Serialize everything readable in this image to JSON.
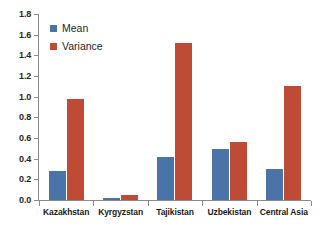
{
  "chart_data": {
    "type": "bar",
    "title": "",
    "xlabel": "",
    "ylabel": "",
    "ylim": [
      0,
      1.8
    ],
    "ytick_step": 0.2,
    "grid": false,
    "legend_position": "top-left",
    "categories": [
      "Kazakhstan",
      "Kyrgyzstan",
      "Tajikistan",
      "Uzbekistan",
      "Central Asia"
    ],
    "series": [
      {
        "name": "Mean",
        "color": "#4a73a8",
        "values": [
          0.28,
          0.02,
          0.42,
          0.49,
          0.3
        ]
      },
      {
        "name": "Variance",
        "color": "#be4b36",
        "values": [
          0.98,
          0.05,
          1.52,
          0.56,
          1.1
        ]
      }
    ],
    "ytick_labels": [
      "0.0",
      "0.2",
      "0.4",
      "0.6",
      "0.8",
      "1.0",
      "1.2",
      "1.4",
      "1.6",
      "1.8"
    ],
    "ytick_values": [
      0.0,
      0.2,
      0.4,
      0.6,
      0.8,
      1.0,
      1.2,
      1.4,
      1.6,
      1.8
    ]
  },
  "axis": {
    "line_color": "#8a8a8a"
  }
}
